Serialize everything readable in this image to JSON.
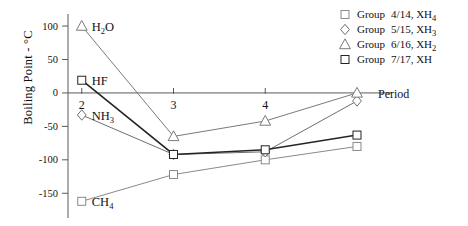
{
  "chart_data": {
    "type": "line",
    "title": "",
    "xlabel": "Period",
    "ylabel": "Boiling Point - °C",
    "x": [
      2,
      3,
      4,
      5
    ],
    "xtick_labels": [
      "2",
      "3",
      "4"
    ],
    "xlim": [
      1.85,
      5.12
    ],
    "ylim": [
      -178,
      118
    ],
    "ytick_labels": [
      "100",
      "50",
      "0",
      "-50",
      "-100",
      "-150"
    ],
    "ytick_values": [
      100,
      50,
      0,
      -50,
      -100,
      -150
    ],
    "grid": false,
    "legend_position": "top-right",
    "series": [
      {
        "name": "Group  4/14, XH₄",
        "legend_main": "Group",
        "legend_value": "4/14, XH",
        "legend_sub": "4",
        "marker": "square",
        "color": "#8a8a8a",
        "values": [
          -162,
          -122,
          -100,
          -80
        ]
      },
      {
        "name": "Group  5/15, XH₃",
        "legend_main": "Group",
        "legend_value": "5/15, XH",
        "legend_sub": "3",
        "marker": "diamond",
        "color": "#6e6e6e",
        "values": [
          -33,
          -92,
          -88,
          -12
        ]
      },
      {
        "name": "Group  6/16, XH₂",
        "legend_main": "Group",
        "legend_value": "6/16, XH",
        "legend_sub": "2",
        "marker": "triangle",
        "color": "#7a7a7a",
        "values": [
          100,
          -65,
          -42,
          0
        ]
      },
      {
        "name": "Group  7/17, XH",
        "legend_main": "Group",
        "legend_value": "7/17, XH",
        "legend_sub": "",
        "marker": "square",
        "color": "#242424",
        "values": [
          19,
          -92,
          -85,
          -63
        ]
      }
    ],
    "annotations": [
      {
        "text": "H",
        "sub": "2",
        "tail": "O",
        "x": 2,
        "y": 100
      },
      {
        "text": "HF",
        "sub": "",
        "tail": "",
        "x": 2,
        "y": 19
      },
      {
        "text": "NH",
        "sub": "3",
        "tail": "",
        "x": 2,
        "y": -33
      },
      {
        "text": "CH",
        "sub": "4",
        "tail": "",
        "x": 2,
        "y": -162
      }
    ]
  },
  "axis": {
    "y_title": "Boiling Point - °C",
    "x_title": "Period",
    "y_ticks": [
      "100",
      "50",
      "0",
      "-50",
      "-100",
      "-150"
    ],
    "x_ticks": [
      "2",
      "3",
      "4"
    ]
  },
  "annotations": {
    "h2o_main": "H",
    "h2o_sub": "2",
    "h2o_tail": "O",
    "hf": "HF",
    "nh3_main": "NH",
    "nh3_sub": "3",
    "ch4_main": "CH",
    "ch4_sub": "4"
  },
  "legend": {
    "rows": [
      {
        "main": "Group",
        "value": "4/14, XH",
        "sub": "4",
        "marker": "square-icon"
      },
      {
        "main": "Group",
        "value": "5/15, XH",
        "sub": "3",
        "marker": "diamond-icon"
      },
      {
        "main": "Group",
        "value": "6/16, XH",
        "sub": "2",
        "marker": "triangle-icon"
      },
      {
        "main": "Group",
        "value": "7/17, XH",
        "sub": "",
        "marker": "square-icon"
      }
    ]
  }
}
